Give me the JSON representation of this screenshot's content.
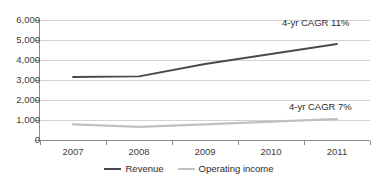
{
  "chart_data": {
    "type": "line",
    "title": "",
    "subtitle": "",
    "xlabel": "",
    "ylabel": "",
    "categories": [
      "2007",
      "2008",
      "2009",
      "2010",
      "2011"
    ],
    "x": [
      2007,
      2008,
      2009,
      2010,
      2011
    ],
    "ylim": [
      0,
      6000
    ],
    "ytick_values": [
      0,
      1000,
      2000,
      3000,
      4000,
      5000,
      6000
    ],
    "ytick_labels": [
      "0",
      "1,000",
      "2,000",
      "3,000",
      "4,000",
      "5,000",
      "6,000"
    ],
    "grid": true,
    "grid_axis": "y",
    "legend_position": "bottom-center",
    "series": [
      {
        "name": "Revenue",
        "color": "#4a4a4a",
        "values": [
          3150,
          3180,
          3800,
          4300,
          4800
        ]
      },
      {
        "name": "Operating income",
        "color": "#bfbfbf",
        "values": [
          780,
          660,
          780,
          920,
          1050
        ]
      }
    ],
    "annotations": [
      {
        "id": "revenue-cagr",
        "text": "4-yr CAGR 11%",
        "series": "Revenue"
      },
      {
        "id": "operating-income-cagr",
        "text": "4-yr CAGR 7%",
        "series": "Operating income"
      }
    ]
  },
  "colors": {
    "revenue": "#4a4a4a",
    "operating_income": "#bfbfbf",
    "gridline": "#d2d2d2",
    "axis": "#8c8c8c",
    "text": "#2b2b2b",
    "background": "#ffffff"
  }
}
